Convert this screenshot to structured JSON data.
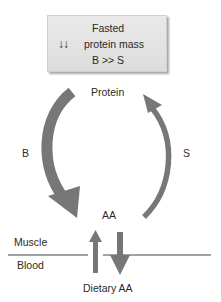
{
  "box": {
    "line1": "Fasted",
    "symbol": "↓↓",
    "line2": "protein mass",
    "line3": "B >> S"
  },
  "labels": {
    "protein": "Protein",
    "breakdown": "B",
    "synthesis": "S",
    "amino_acids": "AA",
    "muscle": "Muscle",
    "blood": "Blood",
    "dietary": "Dietary AA"
  },
  "colors": {
    "arrow": "#777777",
    "box_fill": "#e4e4e4",
    "line": "#444444",
    "text": "#2a2a2a"
  }
}
